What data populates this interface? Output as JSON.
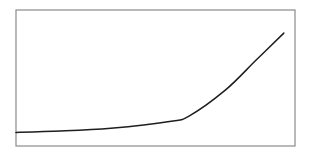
{
  "colors": {
    "background": "#ffffff",
    "frame": "#8a8a8a",
    "line": "#1e1e1e"
  },
  "chart_data": {
    "type": "line",
    "title": "",
    "xlabel": "",
    "ylabel": "",
    "grid": false,
    "legend": null,
    "xlim": [
      0,
      1
    ],
    "ylim": [
      0,
      1
    ],
    "series": [
      {
        "name": "curve",
        "x": [
          0.0,
          0.16,
          0.34,
          0.55,
          0.62,
          0.75,
          0.86,
          0.96
        ],
        "y": [
          0.1,
          0.11,
          0.13,
          0.18,
          0.22,
          0.41,
          0.63,
          0.83
        ]
      }
    ],
    "plot_box_px": {
      "left": 16,
      "top": 10,
      "right": 295,
      "bottom": 146
    }
  }
}
